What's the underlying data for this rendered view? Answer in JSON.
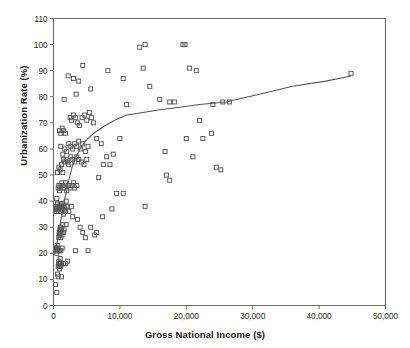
{
  "chart_data": {
    "type": "scatter",
    "title": "",
    "xlabel": "Gross National Income ($)",
    "ylabel": "Urbanization Rate (%)",
    "xlim": [
      0,
      50000
    ],
    "ylim": [
      0,
      110
    ],
    "xticks": [
      0,
      10000,
      20000,
      30000,
      40000,
      50000
    ],
    "xtick_labels": [
      "0",
      "10,000",
      "20,000",
      "30,000",
      "40,000",
      "50,000"
    ],
    "yticks": [
      0,
      10,
      20,
      30,
      40,
      50,
      60,
      70,
      80,
      90,
      100,
      110
    ],
    "ytick_labels": [
      "0",
      "10",
      "20",
      "30",
      "40",
      "50",
      "60",
      "70",
      "80",
      "90",
      "100",
      "110"
    ],
    "grid": false,
    "legend": null,
    "marker": "open-square",
    "marker_color": "#555555",
    "line_color": "#555555",
    "points": [
      [
        300,
        8
      ],
      [
        500,
        5
      ],
      [
        600,
        12
      ],
      [
        700,
        15
      ],
      [
        750,
        16
      ],
      [
        800,
        17
      ],
      [
        850,
        15
      ],
      [
        900,
        14
      ],
      [
        950,
        16
      ],
      [
        1000,
        18
      ],
      [
        1050,
        16
      ],
      [
        1100,
        15
      ],
      [
        400,
        21
      ],
      [
        450,
        22
      ],
      [
        500,
        20
      ],
      [
        550,
        23
      ],
      [
        600,
        21
      ],
      [
        700,
        22
      ],
      [
        800,
        26
      ],
      [
        850,
        28
      ],
      [
        900,
        27
      ],
      [
        950,
        29
      ],
      [
        1000,
        28
      ],
      [
        1050,
        30
      ],
      [
        1100,
        26
      ],
      [
        1200,
        29
      ],
      [
        1300,
        27
      ],
      [
        1400,
        31
      ],
      [
        1500,
        28
      ],
      [
        350,
        37
      ],
      [
        400,
        38
      ],
      [
        420,
        36
      ],
      [
        500,
        41
      ],
      [
        550,
        37
      ],
      [
        600,
        39
      ],
      [
        650,
        38
      ],
      [
        700,
        36
      ],
      [
        800,
        37
      ],
      [
        900,
        38
      ],
      [
        1000,
        39
      ],
      [
        1100,
        36
      ],
      [
        1200,
        38
      ],
      [
        1300,
        37
      ],
      [
        1400,
        39
      ],
      [
        1500,
        35
      ],
      [
        1600,
        38
      ],
      [
        1700,
        37
      ],
      [
        1800,
        36
      ],
      [
        1900,
        40
      ],
      [
        2000,
        38
      ],
      [
        700,
        45
      ],
      [
        800,
        46
      ],
      [
        900,
        44
      ],
      [
        1000,
        46
      ],
      [
        1100,
        45
      ],
      [
        1250,
        47
      ],
      [
        1400,
        46
      ],
      [
        1600,
        45
      ],
      [
        1800,
        47
      ],
      [
        2000,
        44
      ],
      [
        2200,
        46
      ],
      [
        2500,
        45
      ],
      [
        2800,
        46
      ],
      [
        3000,
        47
      ],
      [
        3200,
        45
      ],
      [
        3500,
        46
      ],
      [
        600,
        51
      ],
      [
        800,
        53
      ],
      [
        1000,
        52
      ],
      [
        1200,
        54
      ],
      [
        1400,
        51
      ],
      [
        1500,
        56
      ],
      [
        1700,
        55
      ],
      [
        1900,
        56
      ],
      [
        2100,
        55
      ],
      [
        2300,
        54
      ],
      [
        2600,
        57
      ],
      [
        2900,
        56
      ],
      [
        3200,
        55
      ],
      [
        3500,
        57
      ],
      [
        3800,
        56
      ],
      [
        4200,
        55
      ],
      [
        4600,
        54
      ],
      [
        5000,
        56
      ],
      [
        1100,
        61
      ],
      [
        1400,
        58
      ],
      [
        1700,
        60
      ],
      [
        2000,
        59
      ],
      [
        2300,
        62
      ],
      [
        2600,
        61
      ],
      [
        2900,
        60
      ],
      [
        3200,
        62
      ],
      [
        3500,
        61
      ],
      [
        3800,
        63
      ],
      [
        4100,
        60
      ],
      [
        4400,
        62
      ],
      [
        4800,
        59
      ],
      [
        5200,
        61
      ],
      [
        900,
        67
      ],
      [
        1100,
        66
      ],
      [
        1300,
        68
      ],
      [
        1500,
        67
      ],
      [
        1800,
        66
      ],
      [
        2500,
        72
      ],
      [
        2700,
        71
      ],
      [
        3000,
        73
      ],
      [
        3300,
        72
      ],
      [
        3600,
        70
      ],
      [
        3900,
        69
      ],
      [
        4300,
        72
      ],
      [
        4700,
        73
      ],
      [
        5000,
        71
      ],
      [
        5400,
        74
      ],
      [
        5700,
        72
      ],
      [
        6000,
        70
      ],
      [
        1600,
        79
      ],
      [
        3400,
        81
      ],
      [
        3800,
        86
      ],
      [
        4400,
        92
      ],
      [
        5600,
        83
      ],
      [
        2200,
        88
      ],
      [
        3000,
        87
      ],
      [
        8200,
        90
      ],
      [
        10500,
        87
      ],
      [
        13500,
        91
      ],
      [
        13000,
        99
      ],
      [
        13800,
        100
      ],
      [
        19500,
        100
      ],
      [
        19800,
        100
      ],
      [
        20500,
        91
      ],
      [
        14500,
        84
      ],
      [
        16000,
        79
      ],
      [
        17500,
        78
      ],
      [
        18200,
        78
      ],
      [
        11000,
        77
      ],
      [
        21500,
        90
      ],
      [
        6500,
        64
      ],
      [
        7200,
        62
      ],
      [
        8000,
        57
      ],
      [
        6800,
        49
      ],
      [
        7500,
        54
      ],
      [
        8500,
        54
      ],
      [
        9000,
        58
      ],
      [
        10000,
        64
      ],
      [
        10500,
        43
      ],
      [
        9500,
        43
      ],
      [
        8800,
        37
      ],
      [
        7400,
        34
      ],
      [
        6500,
        28
      ],
      [
        6200,
        27
      ],
      [
        5600,
        30
      ],
      [
        5200,
        21
      ],
      [
        4800,
        26
      ],
      [
        4400,
        28
      ],
      [
        4000,
        30
      ],
      [
        3600,
        33
      ],
      [
        3300,
        21
      ],
      [
        2900,
        34
      ],
      [
        2700,
        38
      ],
      [
        2300,
        36
      ],
      [
        1900,
        31
      ],
      [
        1600,
        29
      ],
      [
        1300,
        22
      ],
      [
        1100,
        21
      ],
      [
        900,
        21
      ],
      [
        700,
        11
      ],
      [
        1200,
        11
      ],
      [
        1500,
        16
      ],
      [
        1800,
        16
      ],
      [
        2100,
        17
      ],
      [
        13800,
        38
      ],
      [
        16800,
        59
      ],
      [
        17000,
        50
      ],
      [
        17500,
        48
      ],
      [
        22500,
        64
      ],
      [
        22000,
        71
      ],
      [
        23800,
        66
      ],
      [
        25500,
        78
      ],
      [
        26500,
        78
      ],
      [
        24000,
        77
      ],
      [
        20000,
        64
      ],
      [
        21000,
        57
      ],
      [
        24500,
        53
      ],
      [
        25200,
        52
      ],
      [
        44800,
        89
      ]
    ],
    "trend_line": [
      [
        200,
        20
      ],
      [
        600,
        25
      ],
      [
        1000,
        31
      ],
      [
        1400,
        37
      ],
      [
        1800,
        42
      ],
      [
        2300,
        48
      ],
      [
        2800,
        53
      ],
      [
        3400,
        57
      ],
      [
        4000,
        60
      ],
      [
        4800,
        63
      ],
      [
        5600,
        65
      ],
      [
        6600,
        67
      ],
      [
        7800,
        69
      ],
      [
        9200,
        71
      ],
      [
        11000,
        73
      ],
      [
        13500,
        74
      ],
      [
        16000,
        75
      ],
      [
        19000,
        76
      ],
      [
        22000,
        77
      ],
      [
        26000,
        78
      ],
      [
        31000,
        81
      ],
      [
        36000,
        84
      ],
      [
        41000,
        86
      ],
      [
        44800,
        88
      ]
    ]
  },
  "axes": {
    "x_title": "Gross National Income ($)",
    "y_title": "Urbanization Rate (%)"
  }
}
